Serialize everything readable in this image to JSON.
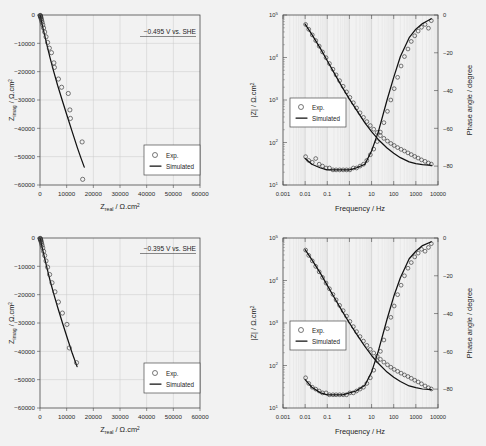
{
  "figure": {
    "background": "#f2f2f2",
    "panel_count": 4
  },
  "legend": {
    "exp_label": "Exp.",
    "sim_label": "Simulated",
    "marker": "circle-marker",
    "line": "solid-line"
  },
  "axis_text": {
    "z_real": "Z",
    "z_real_sub": "real",
    "z_imag": "Z",
    "z_imag_sub": "imag",
    "impedance_unit": "/ Ω.cm",
    "unit_sup": "2",
    "z_mod": "|Z| / Ω.cm",
    "frequency": "Frequency / Hz",
    "phase": "Phase angle / degree"
  },
  "panels": [
    {
      "id": "nyquist-top",
      "annotation": "−0.495 V vs. SHE",
      "position": "top-left"
    },
    {
      "id": "bode-top",
      "annotation": "",
      "position": "top-right"
    },
    {
      "id": "nyquist-bottom",
      "annotation": "−0.395 V vs. SHE",
      "position": "bottom-left"
    },
    {
      "id": "bode-bottom",
      "annotation": "",
      "position": "bottom-right"
    }
  ],
  "chart_data": [
    {
      "type": "scatter",
      "id": "nyquist-top",
      "title": "",
      "annotation": "−0.495 V vs. SHE",
      "xlabel": "Z_real / Ω.cm2",
      "ylabel": "Z_imag / Ω.cm2",
      "xlim": [
        0,
        60000
      ],
      "ylim": [
        0,
        -60000
      ],
      "xticks": [
        0,
        10000,
        20000,
        30000,
        40000,
        50000,
        60000
      ],
      "yticks": [
        0,
        -10000,
        -20000,
        -30000,
        -40000,
        -50000,
        -60000
      ],
      "grid": true,
      "legend_position": "lower-right",
      "series": [
        {
          "name": "Exp.",
          "marker": "open-circle",
          "x": [
            60,
            110,
            170,
            240,
            330,
            450,
            600,
            800,
            1050,
            1350,
            1750,
            2250,
            2850,
            3500,
            4300,
            5200,
            5400,
            6900,
            8100,
            10600,
            11200,
            11400,
            15800,
            16000
          ],
          "y": [
            -150,
            -260,
            -420,
            -650,
            -950,
            -1350,
            -1900,
            -2600,
            -3500,
            -4600,
            -6000,
            -7700,
            -9700,
            -11700,
            -13300,
            -16900,
            -18500,
            -22600,
            -25500,
            -27700,
            -33500,
            -36500,
            -44800,
            -58000
          ]
        },
        {
          "name": "Simulated",
          "line": "solid",
          "x": [
            30,
            120,
            300,
            620,
            1100,
            1800,
            2700,
            3800,
            5100,
            6600,
            8300,
            10100,
            12000,
            14000,
            15400,
            16600
          ],
          "y": [
            -80,
            -400,
            -1100,
            -2500,
            -4600,
            -7400,
            -11000,
            -15200,
            -19800,
            -24800,
            -30000,
            -35400,
            -41000,
            -46800,
            -50600,
            -53700
          ]
        }
      ]
    },
    {
      "type": "line",
      "id": "bode-top",
      "title": "",
      "xlabel": "Frequency / Hz",
      "ylabel": "|Z| / Ω.cm2",
      "y2label": "Phase angle / degree",
      "xscale": "log",
      "yscale": "log",
      "xlim": [
        0.001,
        10000
      ],
      "ylim": [
        10,
        100000
      ],
      "y2lim": [
        -90,
        0
      ],
      "xticks": [
        0.001,
        0.01,
        0.1,
        1,
        10,
        100,
        1000,
        10000
      ],
      "yticks": [
        10,
        100,
        1000,
        10000,
        100000
      ],
      "y2ticks": [
        0,
        -20,
        -40,
        -60,
        -80
      ],
      "grid": true,
      "legend_position": "middle-left",
      "series": [
        {
          "name": "|Z| Exp.",
          "axis": "left",
          "marker": "open-circle",
          "x": [
            0.0105,
            0.0145,
            0.021,
            0.03,
            0.043,
            0.061,
            0.088,
            0.125,
            0.18,
            0.25,
            0.36,
            0.52,
            0.74,
            1.05,
            1.5,
            2.1,
            3.0,
            4.3,
            6.1,
            8.8,
            12.5,
            18,
            25,
            36,
            52,
            74,
            105,
            150,
            215,
            305,
            440,
            620,
            890,
            1270,
            1800,
            2600,
            3700,
            5000
          ],
          "y": [
            60000,
            46000,
            34000,
            25000,
            18500,
            13500,
            9900,
            7200,
            5300,
            3900,
            2850,
            2100,
            1550,
            1150,
            860,
            650,
            500,
            390,
            310,
            250,
            205,
            172,
            145,
            125,
            108,
            95,
            85,
            76,
            69,
            63,
            57,
            52,
            47,
            43,
            39,
            36,
            33,
            31
          ]
        },
        {
          "name": "|Z| Simulated",
          "axis": "left",
          "line": "solid",
          "x": [
            0.01,
            0.02,
            0.05,
            0.1,
            0.2,
            0.5,
            1,
            2,
            5,
            10,
            20,
            50,
            100,
            200,
            500,
            1000,
            2000,
            5000
          ],
          "y": [
            61000,
            35000,
            16000,
            8400,
            4400,
            1900,
            1050,
            600,
            290,
            180,
            118,
            74,
            56,
            44,
            35,
            32,
            30,
            29
          ]
        },
        {
          "name": "Phase Exp.",
          "axis": "right",
          "marker": "open-circle",
          "x": [
            0.0105,
            0.0145,
            0.021,
            0.03,
            0.043,
            0.061,
            0.088,
            0.125,
            0.18,
            0.25,
            0.36,
            0.52,
            0.74,
            1.05,
            1.5,
            2.1,
            3.0,
            4.3,
            6.1,
            8.8,
            12.5,
            18,
            25,
            36,
            52,
            74,
            105,
            150,
            215,
            305,
            440,
            620,
            890,
            1270,
            1800,
            2600,
            3700,
            5000
          ],
          "y": [
            -75,
            -77,
            -78,
            -76,
            -79,
            -80,
            -81,
            -81,
            -82,
            -82,
            -82,
            -82,
            -82,
            -82,
            -81,
            -81,
            -80,
            -79,
            -77,
            -74,
            -71,
            -67,
            -62,
            -57,
            -51,
            -45,
            -39,
            -33,
            -27,
            -22,
            -18,
            -14,
            -11,
            -8.5,
            -6.5,
            -5,
            -7,
            -3
          ]
        },
        {
          "name": "Phase Simulated",
          "axis": "right",
          "line": "solid",
          "x": [
            0.01,
            0.02,
            0.05,
            0.1,
            0.2,
            0.5,
            1,
            2,
            5,
            10,
            20,
            50,
            100,
            200,
            500,
            1000,
            2000,
            5000
          ],
          "y": [
            -76,
            -79,
            -81,
            -82,
            -82,
            -82,
            -82,
            -81,
            -79,
            -72,
            -62,
            -45,
            -33,
            -22,
            -12,
            -7.5,
            -4.5,
            -2
          ]
        }
      ]
    },
    {
      "type": "scatter",
      "id": "nyquist-bottom",
      "title": "",
      "annotation": "−0.395 V vs. SHE",
      "xlabel": "Z_real / Ω.cm2",
      "ylabel": "Z_imag / Ω.cm2",
      "xlim": [
        0,
        60000
      ],
      "ylim": [
        0,
        -60000
      ],
      "xticks": [
        0,
        10000,
        20000,
        30000,
        40000,
        50000,
        60000
      ],
      "yticks": [
        0,
        -10000,
        -20000,
        -30000,
        -40000,
        -50000,
        -60000
      ],
      "grid": true,
      "legend_position": "lower-right",
      "series": [
        {
          "name": "Exp.",
          "marker": "open-circle",
          "x": [
            50,
            100,
            160,
            230,
            320,
            440,
            590,
            790,
            1040,
            1350,
            1750,
            2250,
            2850,
            3600,
            4500,
            5600,
            6900,
            8400,
            10100,
            11000,
            13700
          ],
          "y": [
            -130,
            -250,
            -420,
            -640,
            -940,
            -1350,
            -1900,
            -2600,
            -3500,
            -4700,
            -6200,
            -8100,
            -10300,
            -12900,
            -15800,
            -19000,
            -22600,
            -26500,
            -30500,
            -38800,
            -44000
          ]
        },
        {
          "name": "Simulated",
          "line": "solid",
          "x": [
            25,
            110,
            290,
            600,
            1080,
            1780,
            2700,
            3800,
            5150,
            6700,
            8400,
            10200,
            12100,
            13900
          ],
          "y": [
            -70,
            -380,
            -1050,
            -2400,
            -4500,
            -7300,
            -10900,
            -15100,
            -19700,
            -24700,
            -29900,
            -35200,
            -40700,
            -45400
          ]
        }
      ]
    },
    {
      "type": "line",
      "id": "bode-bottom",
      "title": "",
      "xlabel": "Frequency / Hz",
      "ylabel": "|Z| / Ω.cm2",
      "y2label": "Phase angle / degree",
      "xscale": "log",
      "yscale": "log",
      "xlim": [
        0.001,
        10000
      ],
      "ylim": [
        10,
        100000
      ],
      "y2lim": [
        -90,
        0
      ],
      "xticks": [
        0.001,
        0.01,
        0.1,
        1,
        10,
        100,
        1000,
        10000
      ],
      "yticks": [
        10,
        100,
        1000,
        10000,
        100000
      ],
      "y2ticks": [
        0,
        -20,
        -40,
        -60,
        -80
      ],
      "grid": true,
      "legend_position": "middle-left",
      "series": [
        {
          "name": "|Z| Exp.",
          "axis": "left",
          "marker": "open-circle",
          "x": [
            0.0105,
            0.0145,
            0.021,
            0.03,
            0.043,
            0.061,
            0.088,
            0.125,
            0.18,
            0.25,
            0.36,
            0.52,
            0.74,
            1.05,
            1.5,
            2.1,
            3.0,
            4.3,
            6.1,
            8.8,
            12.5,
            18,
            25,
            36,
            52,
            74,
            105,
            150,
            215,
            305,
            440,
            620,
            890,
            1270,
            1800,
            2600,
            3700,
            5000
          ],
          "y": [
            52000,
            39000,
            29000,
            21500,
            16000,
            11800,
            8700,
            6400,
            4700,
            3500,
            2600,
            1950,
            1450,
            1090,
            820,
            625,
            480,
            375,
            298,
            240,
            197,
            165,
            140,
            120,
            104,
            91,
            81,
            73,
            66,
            60,
            55,
            50,
            45,
            41,
            37,
            33,
            30,
            28
          ]
        },
        {
          "name": "|Z| Simulated",
          "axis": "left",
          "line": "solid",
          "x": [
            0.01,
            0.02,
            0.05,
            0.1,
            0.2,
            0.5,
            1,
            2,
            5,
            10,
            20,
            50,
            100,
            200,
            500,
            1000,
            2000,
            5000
          ],
          "y": [
            53000,
            31000,
            14500,
            7700,
            4100,
            1800,
            1000,
            570,
            280,
            172,
            113,
            70,
            53,
            42,
            33,
            30,
            28,
            27
          ]
        },
        {
          "name": "Phase Exp.",
          "axis": "right",
          "marker": "open-circle",
          "x": [
            0.0105,
            0.0145,
            0.021,
            0.03,
            0.043,
            0.061,
            0.088,
            0.125,
            0.18,
            0.25,
            0.36,
            0.52,
            0.74,
            1.05,
            1.5,
            2.1,
            3.0,
            4.3,
            6.1,
            8.8,
            12.5,
            18,
            25,
            36,
            52,
            74,
            105,
            150,
            215,
            305,
            440,
            620,
            890,
            1270,
            1800,
            2600,
            3700,
            5000
          ],
          "y": [
            -74,
            -77,
            -79,
            -80,
            -81,
            -82,
            -82,
            -83,
            -83,
            -83,
            -83,
            -83,
            -83,
            -82,
            -82,
            -81,
            -80,
            -79,
            -77,
            -74,
            -70,
            -65,
            -60,
            -54,
            -48,
            -42,
            -36,
            -30,
            -25,
            -20,
            -16,
            -13,
            -10,
            -8,
            -6,
            -7,
            -5,
            -3
          ]
        },
        {
          "name": "Phase Simulated",
          "axis": "right",
          "line": "solid",
          "x": [
            0.01,
            0.02,
            0.05,
            0.1,
            0.2,
            0.5,
            1,
            2,
            5,
            10,
            20,
            50,
            100,
            200,
            500,
            1000,
            2000,
            5000
          ],
          "y": [
            -75,
            -79,
            -82,
            -83,
            -83,
            -83,
            -82,
            -81,
            -78,
            -71,
            -60,
            -43,
            -31,
            -21,
            -11,
            -7,
            -4,
            -2
          ]
        }
      ]
    }
  ]
}
